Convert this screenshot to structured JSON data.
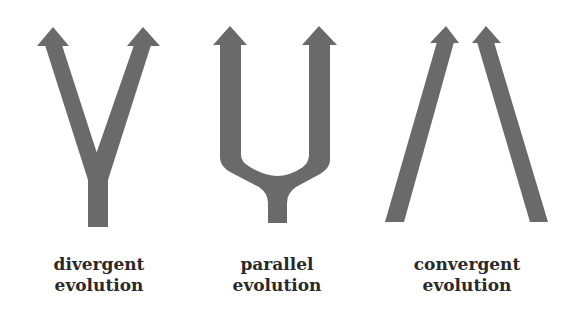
{
  "colors": {
    "arrow_fill": "#6a6a6a",
    "label_text": "#2a2a2a",
    "background": "#ffffff"
  },
  "panels": [
    {
      "id": "divergent",
      "shape": "Y-shaped arrow: single stem splitting into two diverging arrows",
      "label_line1": "divergent",
      "label_line2": "evolution"
    },
    {
      "id": "parallel",
      "shape": "U-shaped fork arrow: single stem splitting into two parallel upward arrows",
      "label_line1": "parallel",
      "label_line2": "evolution"
    },
    {
      "id": "convergent",
      "shape": "Two separate arrows starting far apart and converging toward the top",
      "label_line1": "convergent",
      "label_line2": "evolution"
    }
  ]
}
